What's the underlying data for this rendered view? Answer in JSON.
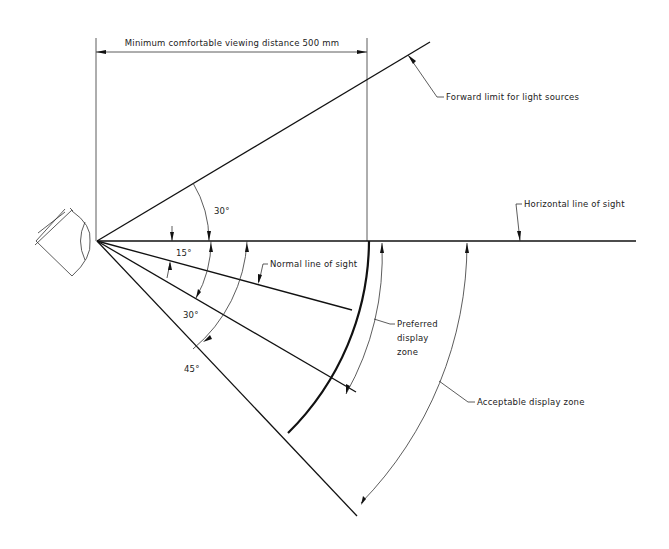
{
  "diagram": {
    "labels": {
      "min_distance": "Minimum comfortable viewing distance 500 mm",
      "forward_limit": "Forward limit for light sources",
      "horizontal_line": "Horizontal line of sight",
      "normal_line": "Normal line of sight",
      "preferred_zone_1": "Preferred",
      "preferred_zone_2": "display",
      "preferred_zone_3": "zone",
      "acceptable_zone": "Acceptable display zone"
    },
    "angles": {
      "upward": "30°",
      "normal": "15°",
      "lower_preferred": "30°",
      "lower_acceptable": "45°"
    },
    "geometry": {
      "eye_vertex": [
        97,
        241
      ],
      "horizontal_end_x": 636,
      "upward_angle_deg": 30,
      "normal_angle_deg": 15,
      "preferred_lower_deg": 30,
      "acceptable_lower_deg": 45,
      "min_distance_mm": 500
    }
  }
}
